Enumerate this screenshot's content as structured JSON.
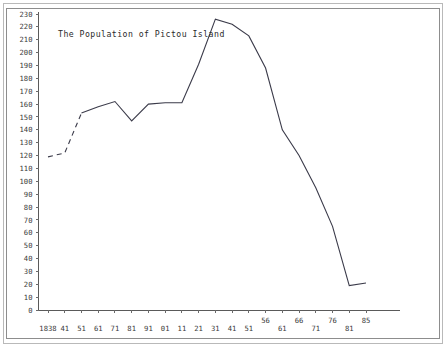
{
  "figure": {
    "title": "The Population of Pictou Island",
    "border_color": "#8d8d8d",
    "outer_border_color": "#b9b9b9",
    "line_color": "#3b3b4a",
    "background": "#ffffff"
  },
  "chart_data": {
    "type": "line",
    "title": "The Population of Pictou Island",
    "xlabel": "",
    "ylabel": "",
    "grid": false,
    "legend": null,
    "ylim": [
      0,
      230
    ],
    "ytick_step": 10,
    "yticks": [
      230,
      220,
      210,
      200,
      190,
      180,
      170,
      160,
      150,
      140,
      130,
      120,
      110,
      100,
      90,
      80,
      70,
      60,
      50,
      40,
      30,
      20,
      10,
      0
    ],
    "xticks": [
      "1838",
      "41",
      "51",
      "61",
      "71",
      "81",
      "91",
      "01",
      "11",
      "21",
      "31",
      "41",
      "51",
      "56",
      "61",
      "66",
      "71",
      "76",
      "81",
      "85"
    ],
    "xtick_rows": [
      0,
      0,
      0,
      0,
      0,
      0,
      0,
      0,
      0,
      0,
      0,
      0,
      0,
      1,
      0,
      1,
      0,
      1,
      0,
      1
    ],
    "categories": [
      "1838",
      "1841",
      "1851",
      "1861",
      "1871",
      "1881",
      "1891",
      "1901",
      "1911",
      "1921",
      "1931",
      "1941",
      "1951",
      "1956",
      "1961",
      "1966",
      "1971",
      "1976",
      "1981",
      "1985"
    ],
    "values": [
      119,
      122,
      153,
      158,
      162,
      147,
      160,
      161,
      161,
      191,
      226,
      222,
      213,
      188,
      140,
      120,
      95,
      65,
      19,
      21
    ],
    "series": [
      {
        "name": "Population",
        "values": [
          119,
          122,
          153,
          158,
          162,
          147,
          160,
          161,
          161,
          191,
          226,
          222,
          213,
          188,
          140,
          120,
          95,
          65,
          19,
          21
        ],
        "dashed_from_index": 0,
        "dashed_to_index": 2,
        "note": "estimated segment drawn dashed between 1838 and 1851"
      }
    ]
  },
  "axes": {
    "y_min_label": "0",
    "y_max_label": "230"
  }
}
